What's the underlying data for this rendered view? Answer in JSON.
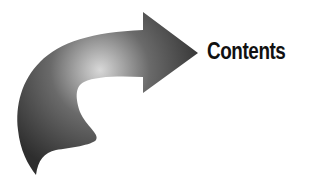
{
  "heading": {
    "label": "Contents"
  },
  "graphic": {
    "icon": "curved-arrow-right-icon",
    "colors": {
      "highlight": "#d8d8d8",
      "mid": "#6a6a6a",
      "dark": "#2e2e2e"
    }
  }
}
